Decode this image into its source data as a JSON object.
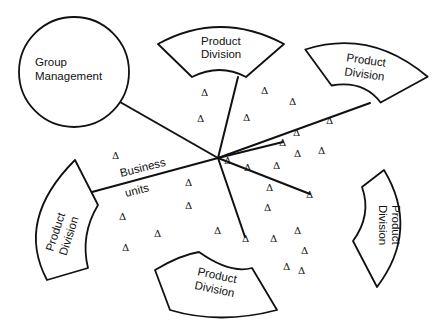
{
  "diagram": {
    "hub": {
      "x": 218,
      "y": 158
    },
    "group_management": {
      "label_line1": "Group",
      "label_line2": "Management",
      "cx": 74,
      "cy": 72,
      "r": 55
    },
    "business_units_label": {
      "line1": "Business",
      "line2": "units"
    },
    "product_divisions": [
      {
        "id": "top",
        "line1": "Product",
        "line2": "Division"
      },
      {
        "id": "top-right",
        "line1": "Product",
        "line2": "Division"
      },
      {
        "id": "right",
        "line1": "Product",
        "line2": "Division"
      },
      {
        "id": "bottom",
        "line1": "Product",
        "line2": "Division"
      },
      {
        "id": "left",
        "line1": "Product",
        "line2": "Division"
      }
    ],
    "triangle_glyph": "Δ",
    "triangles": [
      [
        205,
        92
      ],
      [
        265,
        90
      ],
      [
        293,
        101
      ],
      [
        201,
        118
      ],
      [
        247,
        117
      ],
      [
        330,
        120
      ],
      [
        297,
        132
      ],
      [
        283,
        142
      ],
      [
        322,
        150
      ],
      [
        298,
        153
      ],
      [
        277,
        165
      ],
      [
        248,
        167
      ],
      [
        270,
        187
      ],
      [
        310,
        194
      ],
      [
        189,
        182
      ],
      [
        189,
        205
      ],
      [
        123,
        216
      ],
      [
        158,
        233
      ],
      [
        126,
        247
      ],
      [
        218,
        230
      ],
      [
        246,
        238
      ],
      [
        274,
        238
      ],
      [
        298,
        230
      ],
      [
        305,
        250
      ],
      [
        116,
        155
      ],
      [
        268,
        207
      ],
      [
        287,
        266
      ],
      [
        302,
        270
      ],
      [
        228,
        160
      ]
    ],
    "colors": {
      "stroke": "#111111",
      "background": "#ffffff"
    }
  }
}
